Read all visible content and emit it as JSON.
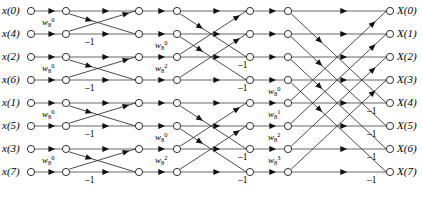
{
  "figure": {
    "type": "fft-butterfly-signal-flow-graph",
    "points": 8,
    "stages": 3,
    "inputs": [
      "x(0)",
      "x(4)",
      "x(2)",
      "x(6)",
      "x(1)",
      "x(5)",
      "x(3)",
      "x(7)"
    ],
    "outputs": [
      "X(0)",
      "X(1)",
      "X(2)",
      "X(3)",
      "X(4)",
      "X(5)",
      "X(6)",
      "X(7)"
    ],
    "negative_one": "–1",
    "twiddle_base": "w",
    "twiddle_sub": "8",
    "stage1": {
      "twiddles": [
        {
          "row": 1,
          "exp": "0"
        },
        {
          "row": 3,
          "exp": "0"
        },
        {
          "row": 5,
          "exp": "0"
        },
        {
          "row": 7,
          "exp": "0"
        }
      ],
      "minus_rows": [
        1,
        3,
        5,
        7
      ]
    },
    "stage2": {
      "twiddles": [
        {
          "row": 2,
          "exp": "0"
        },
        {
          "row": 3,
          "exp": "2"
        },
        {
          "row": 6,
          "exp": "0"
        },
        {
          "row": 7,
          "exp": "2"
        }
      ],
      "minus_rows": [
        2,
        3,
        6,
        7
      ]
    },
    "stage3": {
      "twiddles": [
        {
          "row": 4,
          "exp": "0"
        },
        {
          "row": 5,
          "exp": "1"
        },
        {
          "row": 6,
          "exp": "2"
        },
        {
          "row": 7,
          "exp": "3"
        }
      ],
      "minus_rows": [
        4,
        5,
        6,
        7
      ]
    },
    "colors": {
      "line": "#4d4d4d",
      "cross": "#2b2b2b",
      "node_stroke": "#1a1a1a",
      "node_fill": "#ffffff",
      "text": "#000000"
    }
  }
}
